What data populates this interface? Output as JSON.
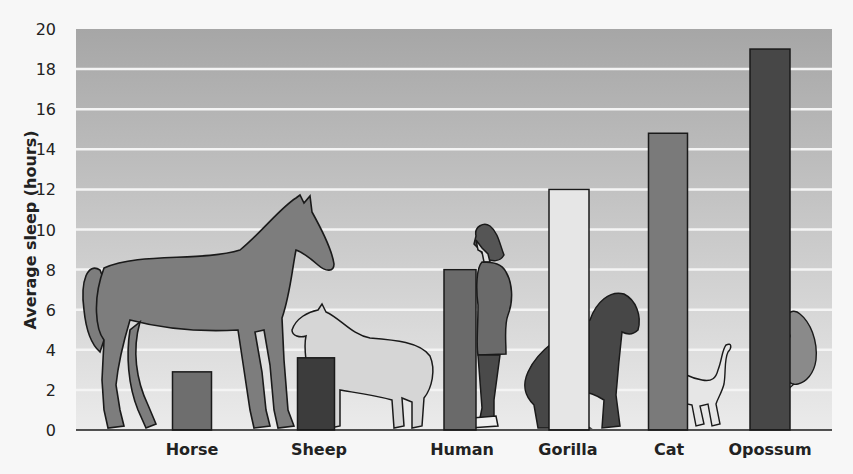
{
  "chart_data": {
    "type": "bar",
    "title": "",
    "xlabel": "",
    "ylabel": "Average sleep (hours)",
    "ylim": [
      0,
      20
    ],
    "yticks": [
      0,
      2,
      4,
      6,
      8,
      10,
      12,
      14,
      16,
      18,
      20
    ],
    "grid": true,
    "legend": null,
    "categories": [
      "Horse",
      "Sheep",
      "Human",
      "Gorilla",
      "Cat",
      "Opossum"
    ],
    "values": [
      2.9,
      3.6,
      8,
      12,
      14.8,
      19
    ],
    "bar_colors": [
      "#6e6e6e",
      "#3c3c3c",
      "#6a6a6a",
      "#e6e6e6",
      "#7a7a7a",
      "#474747"
    ],
    "annotations": [
      "Illustrations of a horse, sheep, human, gorilla, cat and opossum drawn beside their bars"
    ]
  },
  "colors": {
    "plot_top": "#a6a6a6",
    "plot_bottom": "#ebebeb",
    "gridline": "#f4f4f4",
    "outline": "#1a1a1a"
  }
}
